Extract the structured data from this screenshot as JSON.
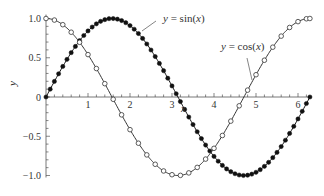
{
  "chart_data": {
    "type": "line",
    "title": "",
    "xlabel": "x",
    "ylabel": "y",
    "xlim": [
      0,
      6.2832
    ],
    "ylim": [
      -1.0,
      1.0
    ],
    "grid": false,
    "legend": "none (inline annotations with leader lines)",
    "x_ticks": [
      1,
      2,
      3,
      4,
      5,
      6
    ],
    "x_tick_labels": [
      "1",
      "2",
      "3",
      "4",
      "5",
      "6"
    ],
    "x_minor_step": 0.2,
    "y_ticks": [
      -1.0,
      -0.5,
      0,
      0.5,
      1.0
    ],
    "y_tick_labels": [
      "-1.0",
      "-0.5",
      "0",
      "0.5",
      "1.0"
    ],
    "y_minor_step": 0.1,
    "series": [
      {
        "name": "y = sin(x)",
        "function": "sin",
        "marker": "filled-circle",
        "marker_step": 0.1,
        "x_range": [
          0,
          6.2832
        ],
        "color": "#111111",
        "sample_values": {
          "0": 0,
          "1.5708": 1.0,
          "3.1416": 0,
          "4.7124": -1.0,
          "6.2832": 0
        }
      },
      {
        "name": "y = cos(x)",
        "function": "cos",
        "marker": "open-circle",
        "marker_step": 0.2,
        "x_range": [
          0,
          6.2832
        ],
        "color": "#333333",
        "sample_values": {
          "0": 1.0,
          "1.5708": 0,
          "3.1416": -1.0,
          "4.7124": 0,
          "6.2832": 1.0
        }
      }
    ],
    "annotations": [
      {
        "text_pre": "y",
        "text_mid": " = sin(",
        "text_var": "x",
        "text_post": ")",
        "for": "y = sin(x)"
      },
      {
        "text_pre": "y",
        "text_mid": " = cos(",
        "text_var": "x",
        "text_post": ")",
        "for": "y = cos(x)"
      }
    ]
  }
}
